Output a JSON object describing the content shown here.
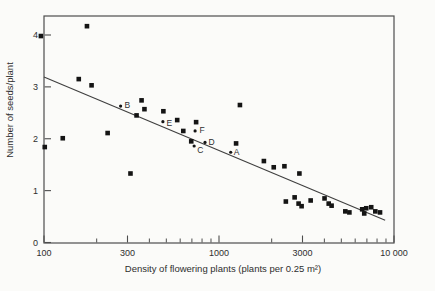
{
  "chart_data": {
    "type": "scatter",
    "title": "",
    "xlabel": "Density of flowering plants (plants per 0.25 m²)",
    "ylabel": "Number of seeds/plant",
    "x_scale": "log",
    "y_scale": "linear",
    "xlim": [
      100,
      10000
    ],
    "ylim": [
      0,
      4.37
    ],
    "grid": false,
    "tick_direction": "in",
    "x_major_ticks": [
      {
        "v": 100,
        "label": "100"
      },
      {
        "v": 300,
        "label": "300"
      },
      {
        "v": 1000,
        "label": "1000"
      },
      {
        "v": 3000,
        "label": "3000"
      },
      {
        "v": 10000,
        "label": "10 000"
      }
    ],
    "x_minor_ticks": [
      200,
      400,
      500,
      600,
      700,
      800,
      900,
      2000,
      4000,
      5000,
      6000,
      7000,
      8000,
      9000
    ],
    "y_ticks": [
      {
        "v": 0,
        "label": "0"
      },
      {
        "v": 1,
        "label": "1"
      },
      {
        "v": 2,
        "label": "2"
      },
      {
        "v": 3,
        "label": "3"
      },
      {
        "v": 4,
        "label": "4"
      }
    ],
    "points": [
      [
        96,
        3.98
      ],
      [
        176,
        4.17
      ],
      [
        158,
        3.15
      ],
      [
        187,
        3.03
      ],
      [
        101,
        1.84
      ],
      [
        128,
        2.01
      ],
      [
        231,
        2.11
      ],
      [
        361,
        2.74
      ],
      [
        375,
        2.57
      ],
      [
        338,
        2.45
      ],
      [
        312,
        1.33
      ],
      [
        481,
        2.53
      ],
      [
        577,
        2.36
      ],
      [
        625,
        2.15
      ],
      [
        740,
        2.32
      ],
      [
        694,
        1.95
      ],
      [
        1317,
        2.65
      ],
      [
        1252,
        1.91
      ],
      [
        1805,
        1.57
      ],
      [
        2055,
        1.45
      ],
      [
        2365,
        1.47
      ],
      [
        2880,
        1.33
      ],
      [
        2410,
        0.79
      ],
      [
        2705,
        0.87
      ],
      [
        2850,
        0.75
      ],
      [
        2965,
        0.7
      ],
      [
        3340,
        0.81
      ],
      [
        4010,
        0.85
      ],
      [
        4235,
        0.75
      ],
      [
        4400,
        0.71
      ],
      [
        5270,
        0.6
      ],
      [
        5560,
        0.58
      ],
      [
        6580,
        0.64
      ],
      [
        6940,
        0.66
      ],
      [
        6760,
        0.56
      ],
      [
        7410,
        0.68
      ],
      [
        7820,
        0.6
      ],
      [
        8320,
        0.58
      ]
    ],
    "labeled_points": [
      {
        "label": "A",
        "x": 1166,
        "y": 1.74,
        "dx": 3,
        "dy": 3
      },
      {
        "label": "B",
        "x": 274,
        "y": 2.63,
        "dx": 4,
        "dy": 2
      },
      {
        "label": "C",
        "x": 721,
        "y": 1.86,
        "dx": 3,
        "dy": 7
      },
      {
        "label": "D",
        "x": 832,
        "y": 1.93,
        "dx": 3.5,
        "dy": 3
      },
      {
        "label": "E",
        "x": 478,
        "y": 2.33,
        "dx": 3.5,
        "dy": 4
      },
      {
        "label": "F",
        "x": 730,
        "y": 2.15,
        "dx": 4.5,
        "dy": 2.5
      }
    ],
    "trend_line": {
      "x1": 100,
      "y1": 3.19,
      "x2": 8900,
      "y2": 0.43
    },
    "colors": {
      "marker": "#141414",
      "dot": "#141414",
      "line": "#3f3f3f",
      "frame": "#4d4d4d",
      "text": "#2e2e2e",
      "background": "#fbfbf9"
    }
  }
}
